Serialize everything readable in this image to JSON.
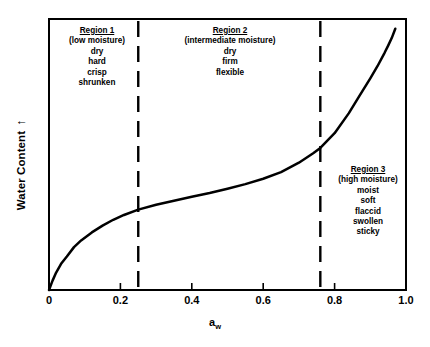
{
  "chart_data": {
    "type": "line",
    "title": "",
    "xlabel": "a_w",
    "xlabel_base": "a",
    "xlabel_sub": "w",
    "ylabel": "Water Content",
    "ylabel_arrow": "↑",
    "xlim": [
      0,
      1.0
    ],
    "ylim": [
      0,
      1.0
    ],
    "grid": false,
    "legend": "none",
    "xticks": [
      "0",
      "0.2",
      "0.4",
      "0.6",
      "0.8",
      "1.0"
    ],
    "xtick_values": [
      0,
      0.2,
      0.4,
      0.6,
      0.8,
      1.0
    ],
    "yticks": [],
    "series": [
      {
        "name": "moisture sorption isotherm",
        "x": [
          0.0,
          0.01,
          0.02,
          0.035,
          0.05,
          0.07,
          0.09,
          0.12,
          0.15,
          0.18,
          0.21,
          0.25,
          0.3,
          0.35,
          0.4,
          0.45,
          0.5,
          0.55,
          0.6,
          0.65,
          0.7,
          0.74,
          0.76,
          0.8,
          0.84,
          0.87,
          0.9,
          0.92,
          0.94,
          0.95,
          0.96,
          0.97
        ],
        "y": [
          0.0,
          0.035,
          0.065,
          0.1,
          0.125,
          0.16,
          0.185,
          0.215,
          0.24,
          0.262,
          0.28,
          0.3,
          0.318,
          0.333,
          0.348,
          0.362,
          0.378,
          0.395,
          0.415,
          0.44,
          0.475,
          0.51,
          0.53,
          0.585,
          0.66,
          0.725,
          0.79,
          0.835,
          0.885,
          0.912,
          0.94,
          0.975
        ]
      }
    ],
    "dividers": [
      {
        "name": "region1-region2-divider",
        "x": 0.25
      },
      {
        "name": "region2-region3-divider",
        "x": 0.76
      }
    ],
    "annotations": {
      "region1": {
        "title": "Region 1",
        "subtitle": "(low moisture)",
        "descriptors": [
          "dry",
          "hard",
          "crisp",
          "shrunken"
        ]
      },
      "region2": {
        "title": "Region 2",
        "subtitle": "(intermediate moisture)",
        "descriptors": [
          "dry",
          "firm",
          "flexible"
        ]
      },
      "region3": {
        "title": "Region 3",
        "subtitle": "(high moisture)",
        "descriptors": [
          "moist",
          "soft",
          "flaccid",
          "swollen",
          "sticky"
        ]
      }
    },
    "colors": {
      "background": "#ffffff",
      "axis": "#000000",
      "curve": "#000000",
      "divider": "#000000",
      "text": "#000000"
    }
  }
}
